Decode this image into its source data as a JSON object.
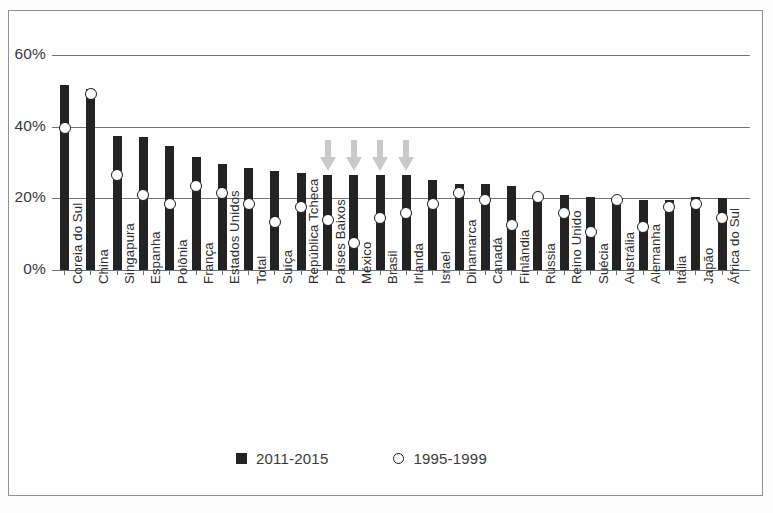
{
  "chart_data": {
    "type": "bar",
    "title": "",
    "subtitle": "",
    "xlabel": "",
    "ylabel": "",
    "ylim": [
      0,
      60
    ],
    "yticks": [
      0,
      20,
      40,
      60
    ],
    "ytick_labels": [
      "0%",
      "20%",
      "40%",
      "60%"
    ],
    "grid": true,
    "legend_position": "bottom-center",
    "value_suffix": "%",
    "categories": [
      "Coreia do Sul",
      "China",
      "Singapura",
      "Espanha",
      "Polônia",
      "França",
      "Estados Unidos",
      "Total",
      "Suíça",
      "República Tcheca",
      "Países Baixos",
      "México",
      "Brasil",
      "Irlanda",
      "Israel",
      "Dinamarca",
      "Canadá",
      "Finlândia",
      "Rússia",
      "Reino Unido",
      "Suécia",
      "Austrália",
      "Alemanha",
      "Itália",
      "Japão",
      "África do Sul"
    ],
    "series": [
      {
        "name": "2011-2015",
        "marker": "square",
        "color": "#232323",
        "values": [
          51.5,
          50.5,
          37.5,
          37.0,
          34.5,
          31.5,
          29.5,
          28.5,
          27.5,
          27.0,
          26.5,
          26.5,
          26.5,
          26.5,
          25.0,
          24.0,
          24.0,
          23.5,
          21.0,
          21.0,
          20.5,
          20.5,
          19.5,
          19.5,
          20.5,
          20.0
        ]
      },
      {
        "name": "1995-1999",
        "marker": "circle",
        "color": "#ffffff",
        "values": [
          39.5,
          49.0,
          26.5,
          21.0,
          18.5,
          23.5,
          21.5,
          18.5,
          13.5,
          17.5,
          14.0,
          7.5,
          14.5,
          16.0,
          18.5,
          21.5,
          19.5,
          12.5,
          20.5,
          16.0,
          10.5,
          19.5,
          12.0,
          17.5,
          18.5,
          14.5
        ]
      }
    ],
    "annotations": {
      "arrows": {
        "icon": "arrow-down-icon",
        "color": "#c9c9c9",
        "target_categories": [
          "Países Baixos",
          "México",
          "Brasil",
          "Irlanda"
        ]
      }
    }
  },
  "legend": {
    "items": [
      {
        "label": "2011-2015",
        "marker": "square-marker"
      },
      {
        "label": "1995-1999",
        "marker": "circle-marker"
      }
    ]
  }
}
